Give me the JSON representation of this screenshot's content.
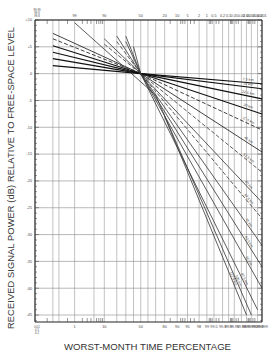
{
  "chart_data": {
    "type": "line",
    "title": "",
    "xlabel": "WORST-MONTH TIME PERCENTAGE",
    "ylabel": "RECEIVED SIGNAL POWER (dB) RELATIVE TO FREE-SPACE LEVEL",
    "x_scale": "normal-probability",
    "x_ticks_top": [
      "99.99",
      "99.9",
      "99.8",
      "99",
      "90",
      "50",
      "20",
      "10",
      "5",
      "2",
      "1",
      "0.5",
      "0.2",
      "0.1",
      "0.05",
      "0.02",
      "0.01",
      "0.005",
      "0.002",
      "0.001"
    ],
    "x_ticks_bottom": [
      "0.01",
      "0.1",
      "0.2",
      "1",
      "10",
      "50",
      "80",
      "90",
      "95",
      "98",
      "99",
      "99.5",
      "99.8",
      "99.9",
      "99.95",
      "99.98",
      "99.99",
      "99.995",
      "99.998",
      "99.999"
    ],
    "y_ticks": [
      10,
      5,
      0,
      -5,
      -10,
      -15,
      -20,
      -25,
      -30,
      -35,
      -40,
      -45
    ],
    "ylim": [
      -46,
      10
    ],
    "grid": true,
    "crossing_point": {
      "x_percent": 50,
      "y_db": 0
    },
    "series": [
      {
        "name": "7.5 km",
        "style": "solid",
        "x": [
          99.9,
          50,
          0.001
        ],
        "values": [
          1.5,
          0,
          -1.9
        ]
      },
      {
        "name": "15 km",
        "style": "solid",
        "x": [
          99.9,
          50,
          0.001
        ],
        "values": [
          2.8,
          0,
          -2.8
        ]
      },
      {
        "name": "22.5 km",
        "style": "solid",
        "x": [
          99.9,
          50,
          0.001
        ],
        "values": [
          4.0,
          0,
          -4.7
        ]
      },
      {
        "name": "30 km",
        "style": "solid",
        "x": [
          99.9,
          50,
          0.001
        ],
        "values": [
          5.2,
          0,
          -7.5
        ]
      },
      {
        "name": "37.5 km",
        "style": "dashed",
        "x": [
          99.9,
          50,
          0.001
        ],
        "values": [
          6.5,
          0,
          -10.5
        ]
      },
      {
        "name": "45 km",
        "style": "solid",
        "x": [
          99.9,
          50,
          0.001
        ],
        "values": [
          7.5,
          0,
          -14.6
        ]
      },
      {
        "name": "52.5 km",
        "style": "dashed",
        "x": [
          90,
          50,
          0.001
        ],
        "values": [
          5.5,
          0,
          -18.4
        ]
      },
      {
        "name": "60 km",
        "style": "solid",
        "x": [
          90,
          50,
          0.001
        ],
        "values": [
          6.5,
          0,
          -24
        ]
      },
      {
        "name": "67.5 km",
        "style": "dashed",
        "x": [
          80,
          50,
          0.001
        ],
        "values": [
          6.0,
          0,
          -27
        ]
      },
      {
        "name": "75 km",
        "style": "solid",
        "x": [
          80,
          50,
          0.001
        ],
        "values": [
          7.0,
          0,
          -32
        ]
      },
      {
        "name": "82.5 km",
        "style": "solid",
        "x": [
          70,
          50,
          0.001
        ],
        "values": [
          6.0,
          0,
          -36
        ]
      },
      {
        "name": "90 km",
        "style": "solid",
        "x": [
          70,
          50,
          0.001
        ],
        "values": [
          7.0,
          0,
          -40
        ]
      },
      {
        "name": "97.5 km",
        "style": "solid",
        "x": [
          60,
          50,
          0.002
        ],
        "values": [
          5.0,
          0,
          -44
        ]
      },
      {
        "name": "105 km",
        "style": "solid",
        "x": [
          99,
          30,
          0.005
        ],
        "values": [
          9.5,
          -4,
          -45
        ]
      },
      {
        "name": "112.5 km",
        "style": "solid",
        "x": [
          20,
          0.01
        ],
        "values": [
          -8,
          -45
        ]
      }
    ]
  }
}
